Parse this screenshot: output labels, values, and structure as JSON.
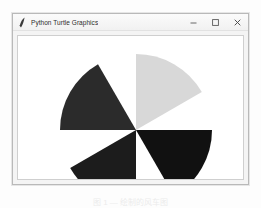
{
  "window": {
    "title": "Python Turtle Graphics",
    "app_icon": "python-feather-icon",
    "controls": [
      {
        "name": "minimize-button",
        "glyph": "minimize-icon",
        "label": "Minimize"
      },
      {
        "name": "maximize-button",
        "glyph": "maximize-icon",
        "label": "Maximize"
      },
      {
        "name": "close-button",
        "glyph": "close-icon",
        "label": "Close"
      }
    ],
    "frame_color": "#b9b9b9",
    "titlebar_color": "#f4f4f4"
  },
  "canvas": {
    "background": "#ffffff",
    "border_color": "#cfcfcf"
  },
  "chart_data": {
    "type": "pie",
    "center": {
      "x": 118,
      "y": 94
    },
    "radius": 76,
    "gap_degrees": 30,
    "sweep_degrees": 60,
    "categories": [
      "upper-right",
      "upper-left",
      "lower-right",
      "lower-left"
    ],
    "values": [
      60,
      60,
      60,
      60
    ],
    "sectors": [
      {
        "name": "sector-upper-right",
        "color": "#d8d8d8",
        "start_deg": 30,
        "end_deg": 90
      },
      {
        "name": "sector-upper-left",
        "color": "#2b2b2b",
        "start_deg": 120,
        "end_deg": 180
      },
      {
        "name": "sector-lower-left",
        "color": "#1c1c1c",
        "start_deg": 210,
        "end_deg": 270
      },
      {
        "name": "sector-lower-right",
        "color": "#111111",
        "start_deg": 300,
        "end_deg": 360
      }
    ],
    "legend": [],
    "grid": false
  },
  "caption": {
    "text": "图 1 — 绘制的风车图"
  }
}
